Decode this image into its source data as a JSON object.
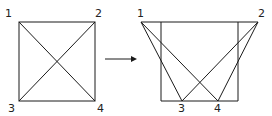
{
  "left_figure": {
    "labels": {
      "p1": "1",
      "p2": "2",
      "p3": "3",
      "p4": "4"
    },
    "description": "Square with both diagonals"
  },
  "arrow": {
    "direction": "right"
  },
  "right_figure": {
    "labels": {
      "p1": "1",
      "p2": "2",
      "p3": "3",
      "p4": "4"
    },
    "description": "Square frame with extended top edge; corners 1 and 2 moved outward, 3 and 4 moved inward along bottom, crossing lines"
  },
  "colors": {
    "stroke": "#1a1a1a",
    "background": "#ffffff"
  }
}
